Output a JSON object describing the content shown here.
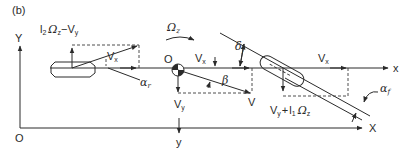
{
  "figure": {
    "panel_label": "(b)"
  },
  "global_axes": {
    "origin_label": "O",
    "x_label": "X",
    "y_label": "Y"
  },
  "vehicle_axes": {
    "origin_label": "O",
    "x_label": "x",
    "y_label": "y"
  },
  "yaw_rate": {
    "symbol": "Ω",
    "sub": "z"
  },
  "rear": {
    "lateral_velocity": {
      "l": "l",
      "l_sub": "2",
      "omega": "Ω",
      "omega_sub": "z",
      "minus": "−",
      "v": "V",
      "v_sub": "y"
    },
    "longitudinal_velocity": {
      "v": "V",
      "v_sub": "x"
    },
    "slip_angle": {
      "symbol": "α",
      "sub": "r"
    }
  },
  "cg": {
    "longitudinal_velocity": {
      "v": "V",
      "v_sub": "x"
    },
    "lateral_velocity": {
      "v": "V",
      "v_sub": "y"
    },
    "total_velocity": "V",
    "sideslip_angle": "β"
  },
  "front": {
    "longitudinal_velocity": {
      "v": "V",
      "v_sub": "x"
    },
    "lateral_velocity": {
      "v": "V",
      "v_sub": "y",
      "plus": "+",
      "l": "l",
      "l_sub": "1",
      "omega": "Ω",
      "omega_sub": "z"
    },
    "steer_angle": {
      "symbol": "δ",
      "sub": "f"
    },
    "slip_angle": {
      "symbol": "α",
      "sub": "f"
    }
  }
}
